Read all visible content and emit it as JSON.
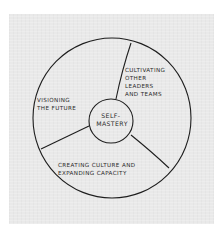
{
  "diagram": {
    "style": "hand-drawn sketch on paper",
    "colors": {
      "paper": "#e9e9e9",
      "ink": "#1e1e1e",
      "background": "#ffffff"
    },
    "center": {
      "lines": [
        "SELF-",
        "MASTERY"
      ]
    },
    "segments": [
      {
        "id": "cultivating",
        "lines": [
          "CULTIVATING",
          "OTHER",
          "LEADERS",
          "AND TEAMS"
        ]
      },
      {
        "id": "visioning",
        "lines": [
          "VISIONING",
          "THE FUTURE"
        ]
      },
      {
        "id": "creating",
        "lines": [
          "CREATING CULTURE AND",
          "EXPANDING CAPACITY"
        ]
      }
    ]
  }
}
